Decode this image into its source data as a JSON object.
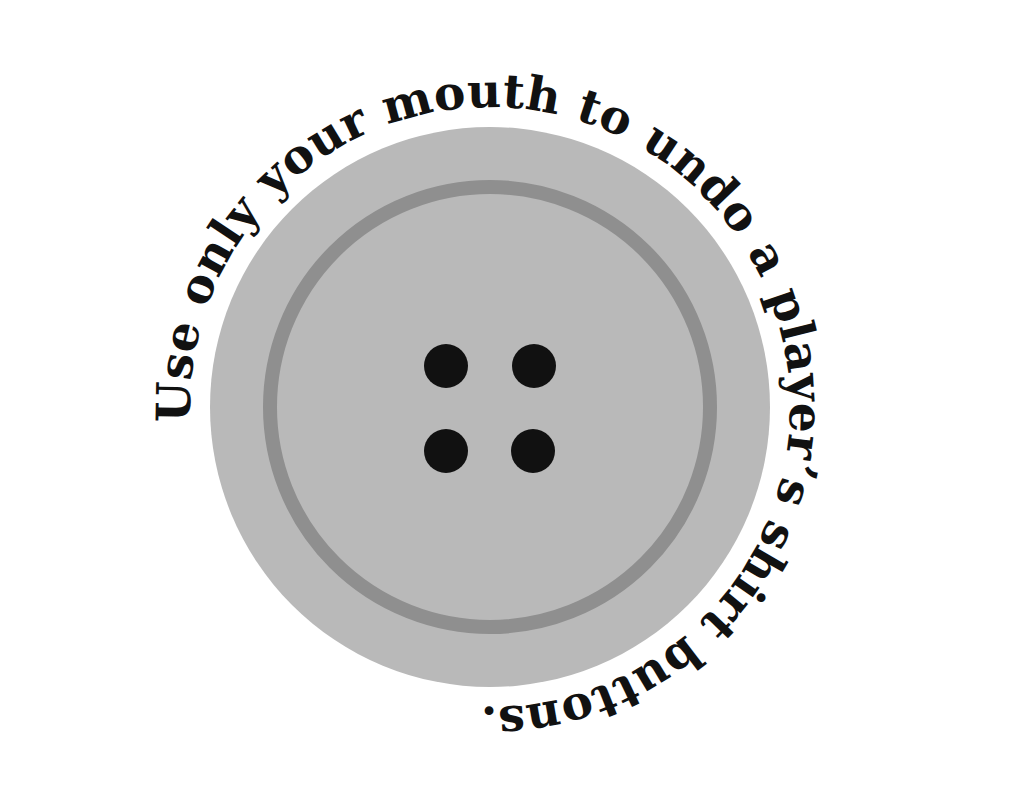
{
  "illustration": {
    "caption": "Use only your mouth to undo a player’s shirt buttons.",
    "subject": "button-icon",
    "colors": {
      "background": "#ffffff",
      "button_face": "#b9b9b9",
      "button_ring": "#8f8f8f",
      "button_holes": "#111111",
      "text": "#111111"
    },
    "button": {
      "center": [
        490,
        407
      ],
      "outer_radius": 280,
      "ring_radius": 220,
      "ring_width": 14,
      "hole_count": 4,
      "hole_radius": 22,
      "holes": [
        [
          446,
          366
        ],
        [
          534,
          366
        ],
        [
          446,
          451
        ],
        [
          533,
          451
        ]
      ]
    },
    "text_path": {
      "radius": 300,
      "start_angle_deg": 183,
      "direction": "clockwise",
      "end_angle_deg": 95
    }
  }
}
